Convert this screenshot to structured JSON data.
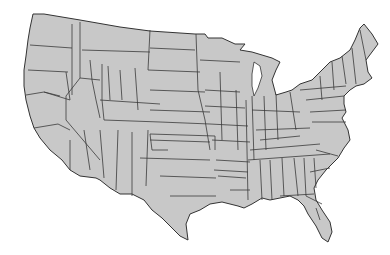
{
  "map": {
    "subject": "Contiguous United States climate divisions",
    "colors": {
      "land": "#c8c8c8",
      "border": "#333333",
      "background": "#ffffff"
    }
  }
}
